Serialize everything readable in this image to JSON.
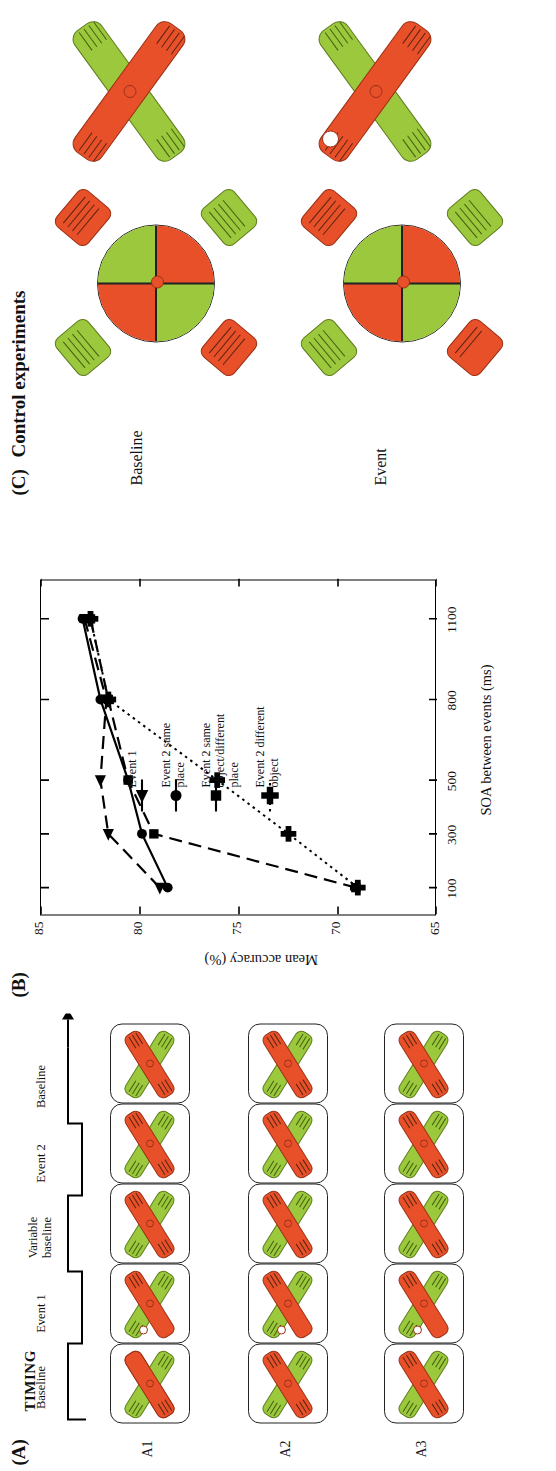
{
  "figure": {
    "panels": [
      {
        "id": "A",
        "label": "(A)",
        "title": "TIMING"
      },
      {
        "id": "B",
        "label": "(B)",
        "title": ""
      },
      {
        "id": "C",
        "label": "(C)",
        "title": "Control experiments"
      }
    ]
  },
  "panelA": {
    "label": "(A)",
    "timing_header": "TIMING",
    "stages": [
      {
        "label": "Baseline"
      },
      {
        "label": "Event 1"
      },
      {
        "label": "Variable\nbaseline"
      },
      {
        "label": "Event 2"
      },
      {
        "label": "Baseline"
      }
    ],
    "stage_labels": [
      "Baseline",
      "Event 1",
      "Variable baseline",
      "Event 2",
      "Baseline"
    ],
    "stage_label_line1": [
      "Baseline",
      "Event 1",
      "Variable",
      "Event 2",
      "Baseline"
    ],
    "stage_label_line2": [
      "",
      "",
      "baseline",
      "",
      ""
    ],
    "rows": [
      {
        "label": "A1"
      },
      {
        "label": "A2"
      },
      {
        "label": "A3"
      }
    ],
    "arrow": "timeline-arrow"
  },
  "panelB": {
    "label": "(B)",
    "legend": [
      {
        "marker": "triangle",
        "line": "dashed",
        "label_line1": "Event 1",
        "label_line2": ""
      },
      {
        "marker": "circle",
        "line": "solid",
        "label_line1": "Event 2 same",
        "label_line2": "place"
      },
      {
        "marker": "square",
        "line": "dashed",
        "label_line1": "Event 2 same",
        "label_line2": "object/different",
        "label_line3": "place"
      },
      {
        "marker": "plus",
        "line": "dotted",
        "label_line1": "Event 2 different",
        "label_line2": "object"
      }
    ]
  },
  "panelC": {
    "label": "(C)",
    "title": "Control experiments",
    "rows": [
      {
        "label": "Baseline"
      },
      {
        "label": "Event"
      }
    ]
  },
  "chart_data": {
    "type": "line",
    "title": "",
    "xlabel": "SOA between events (ms)",
    "ylabel": "Mean accuracy (%)",
    "x": [
      100,
      300,
      500,
      800,
      1100
    ],
    "xtick_labels": [
      "100",
      "300",
      "500",
      "800",
      "1100"
    ],
    "ytick_labels": [
      "65",
      "70",
      "75",
      "80",
      "85"
    ],
    "xlim": [
      0,
      1250
    ],
    "ylim": [
      65,
      85
    ],
    "grid": false,
    "legend_position": "inside-right",
    "series": [
      {
        "name": "Event 1",
        "marker": "triangle",
        "linestyle": "dashed",
        "values": [
          79.0,
          81.6,
          82.0,
          81.7,
          82.8
        ]
      },
      {
        "name": "Event 2 same place",
        "marker": "circle",
        "linestyle": "solid",
        "values": [
          78.6,
          79.9,
          80.6,
          82.0,
          82.9
        ]
      },
      {
        "name": "Event 2 same object/different place",
        "marker": "square",
        "linestyle": "dashed",
        "values": [
          69.1,
          79.3,
          80.6,
          81.6,
          82.5
        ]
      },
      {
        "name": "Event 2 different object",
        "marker": "plus",
        "linestyle": "dotted",
        "values": [
          69.0,
          72.5,
          76.1,
          81.6,
          82.5
        ]
      }
    ]
  }
}
